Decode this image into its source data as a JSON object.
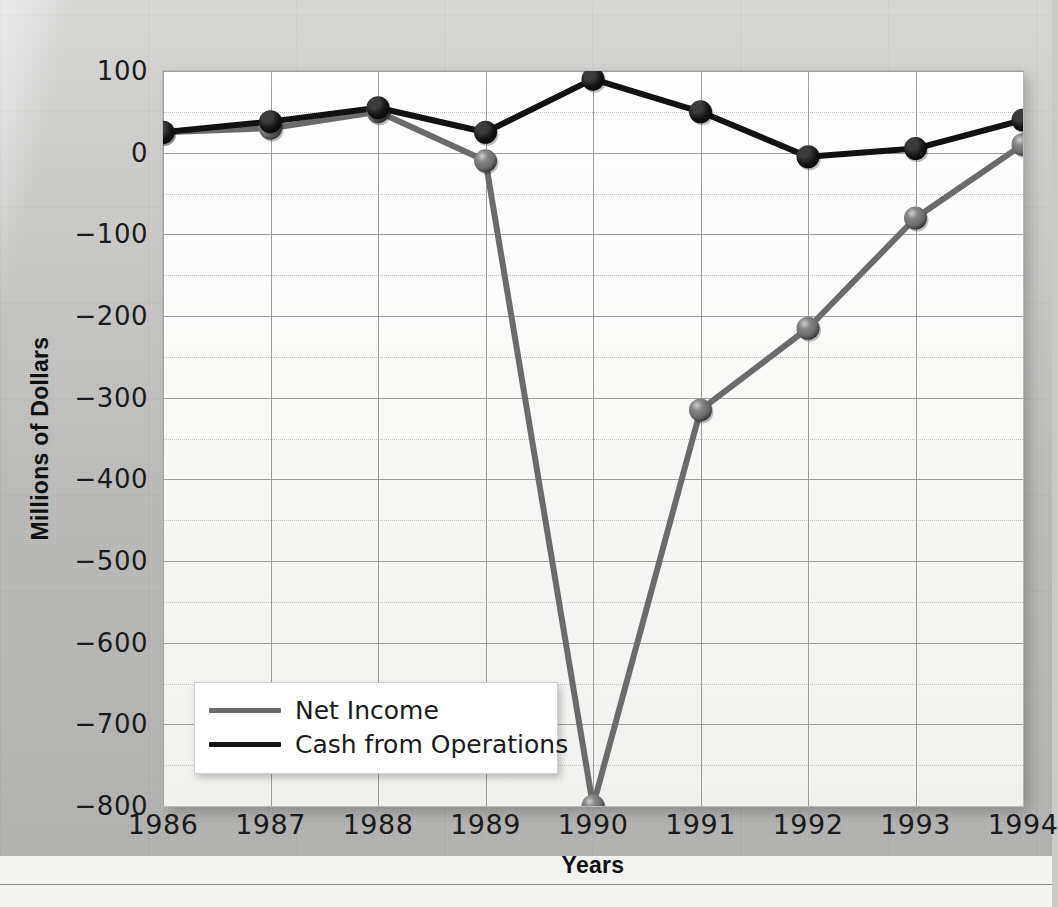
{
  "chart_data": {
    "type": "line",
    "title": "",
    "xlabel": "Years",
    "ylabel": "Millions of Dollars",
    "categories": [
      "1986",
      "1987",
      "1988",
      "1989",
      "1990",
      "1991",
      "1992",
      "1993",
      "1994"
    ],
    "x": [
      1986,
      1987,
      1988,
      1989,
      1990,
      1991,
      1992,
      1993,
      1994
    ],
    "ylim": [
      -800,
      100
    ],
    "xlim": [
      1986,
      1994
    ],
    "y_ticks": [
      100,
      0,
      -100,
      -200,
      -300,
      -400,
      -500,
      -600,
      -700,
      -800
    ],
    "y_tick_labels": [
      "100",
      "0",
      "−100",
      "−200",
      "−300",
      "−400",
      "−500",
      "−600",
      "−700",
      "−800"
    ],
    "grid": true,
    "minor_grid": true,
    "minor_grid_step": 50,
    "legend_position": "lower-left-inside",
    "markers": "sphere",
    "series": [
      {
        "name": "Net Income",
        "color": "#6b6b6b",
        "values": [
          25,
          30,
          50,
          -10,
          -800,
          -315,
          -215,
          -80,
          10
        ]
      },
      {
        "name": "Cash from Operations",
        "color": "#121212",
        "values": [
          25,
          38,
          55,
          25,
          90,
          50,
          -5,
          5,
          40
        ]
      }
    ]
  },
  "legend": {
    "items": [
      {
        "label": "Net Income",
        "color": "#6b6b6b"
      },
      {
        "label": "Cash from Operations",
        "color": "#121212"
      }
    ]
  },
  "axes": {
    "y_title": "Millions of Dollars",
    "x_title": "Years"
  },
  "colors": {
    "net_income": "#6b6b6b",
    "cash_from_operations": "#121212",
    "plot_background": "#fdfdfc",
    "page_background": "#c7c7c5",
    "gridline": "#9e9e9c",
    "minor_gridline": "#c2c2bf"
  }
}
